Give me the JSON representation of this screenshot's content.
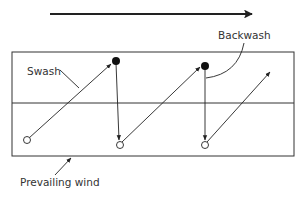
{
  "diagram": {
    "labels": {
      "swash": "Swash",
      "backwash": "Backwash",
      "prevailing_wind": "Prevailing wind"
    },
    "colors": {
      "stroke": "#222222",
      "text": "#333333",
      "background": "#ffffff"
    },
    "elements": {
      "drift_direction_arrow": "long arrow pointing right above the beach",
      "beach_box": "rectangle split horizontally into upper and lower zones",
      "pebble_start_positions": 3,
      "pebble_swash_top_positions": 2
    }
  }
}
